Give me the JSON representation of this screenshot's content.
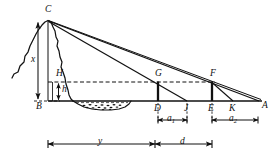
{
  "figure": {
    "kind": "surveying-cross-section-diagram",
    "background_color": "#ffffff",
    "ink_color": "#111111",
    "width": 280,
    "height": 159
  },
  "points": {
    "C": {
      "label": "C",
      "x": 48,
      "y": 20,
      "role": "summit-apex"
    },
    "B": {
      "label": "B",
      "x": 48,
      "y": 101,
      "role": "base-of-vertical"
    },
    "H": {
      "label": "H",
      "x": 62,
      "y": 82,
      "role": "instrument-height-level"
    },
    "G": {
      "label": "G",
      "x": 158,
      "y": 82,
      "role": "staff-top-near"
    },
    "F": {
      "label": "F",
      "x": 212,
      "y": 82,
      "role": "staff-top-far"
    },
    "D": {
      "label": "D",
      "x": 158,
      "y": 101,
      "role": "staff-foot-near"
    },
    "J": {
      "label": "J",
      "x": 187,
      "y": 101,
      "role": "sight-intersection-near"
    },
    "E": {
      "label": "E",
      "x": 212,
      "y": 101,
      "role": "staff-foot-far"
    },
    "K": {
      "label": "K",
      "x": 232,
      "y": 101,
      "role": "sight-intersection-far"
    },
    "A": {
      "label": "A",
      "x": 258,
      "y": 101,
      "role": "baseline-right-end"
    }
  },
  "measures": {
    "x": {
      "label": "x",
      "meaning": "total summit height above base level"
    },
    "H": {
      "label": "H",
      "meaning": "height of sight level above base"
    },
    "h": {
      "label": "h",
      "meaning": "staff height above base level"
    },
    "a1": {
      "label": "a",
      "subscript": "1",
      "meaning": "near stadia interval D to J"
    },
    "a2": {
      "label": "a",
      "subscript": "2",
      "meaning": "far stadia interval E to K"
    },
    "y": {
      "label": "y",
      "meaning": "horizontal distance from B to D"
    },
    "d": {
      "label": "d",
      "meaning": "horizontal distance from D to E"
    }
  },
  "dimension_bars": [
    {
      "name": "a1-bar",
      "label": "a",
      "subscript": "1",
      "x1": 158,
      "x2": 187,
      "y": 120
    },
    {
      "name": "a2-bar",
      "label": "a",
      "subscript": "2",
      "x1": 212,
      "x2": 258,
      "y": 120
    },
    {
      "name": "y-bar",
      "label": "y",
      "x1": 48,
      "x2": 155,
      "y": 144
    },
    {
      "name": "d-bar",
      "label": "d",
      "x1": 155,
      "x2": 212,
      "y": 144
    }
  ],
  "features": {
    "baseline": {
      "name": "ground-baseline",
      "x1": 48,
      "x2": 262,
      "y": 101
    },
    "sight_level_line": {
      "name": "dashed-sight-line",
      "x1": 48,
      "x2": 214,
      "y": 82,
      "style": "dashed"
    },
    "base_dashed_line": {
      "name": "dashed-base-line",
      "x1": 36,
      "x2": 60,
      "y": 101,
      "style": "dashed"
    },
    "terrain": {
      "name": "mountain-profile",
      "style": "jagged-freehand"
    },
    "riverbed": {
      "name": "stippled-riverbed",
      "style": "stippled-depression"
    },
    "sight_lines": [
      {
        "name": "sight-line-C-to-A",
        "from": "C",
        "to": "A"
      },
      {
        "name": "sight-line-C-to-J",
        "from": "C",
        "to": "J"
      },
      {
        "name": "sight-line-F-to-K",
        "from": "F",
        "to": "K"
      }
    ],
    "staffs": [
      {
        "name": "staff-GD",
        "top": "G",
        "bottom": "D"
      },
      {
        "name": "staff-FE",
        "top": "F",
        "bottom": "E"
      }
    ]
  }
}
